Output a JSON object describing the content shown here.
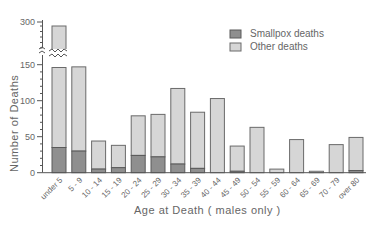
{
  "chart_data": {
    "type": "bar",
    "stacked": true,
    "title": "",
    "xlabel": "Age at Death   ( males only )",
    "ylabel": "Number of Deaths",
    "ylim": [
      0,
      300
    ],
    "y_axis_break": [
      160,
      290
    ],
    "yticks": [
      0,
      50,
      100,
      150,
      300
    ],
    "categories": [
      "under 5",
      "5 - 9",
      "10 - 14",
      "15 - 19",
      "20 - 24",
      "25 - 29",
      "30 - 34",
      "35 - 39",
      "40 - 44",
      "45 - 49",
      "50 - 54",
      "55 - 59",
      "60 - 64",
      "65 - 69",
      "70 - 79",
      "over 80"
    ],
    "totals": [
      290,
      147,
      44,
      38,
      79,
      81,
      117,
      84,
      103,
      37,
      63,
      5,
      46,
      2,
      39,
      49
    ],
    "series": [
      {
        "name": "Smallpox deaths",
        "color": "#8f8f8f",
        "values": [
          35,
          30,
          5,
          7,
          24,
          22,
          12,
          6,
          0,
          2,
          0,
          0,
          0,
          0,
          0,
          3
        ]
      },
      {
        "name": "Other deaths",
        "color": "#d6d6d6",
        "values": [
          255,
          117,
          39,
          31,
          55,
          59,
          105,
          78,
          103,
          35,
          63,
          5,
          46,
          2,
          39,
          46
        ]
      }
    ],
    "legend_position": "upper right",
    "grid": false
  },
  "legend": {
    "smallpox_label": "Smallpox deaths",
    "other_label": "Other deaths"
  },
  "axes": {
    "y_title": "Number of Deaths",
    "x_title": "Age at Death   ( males only )"
  }
}
